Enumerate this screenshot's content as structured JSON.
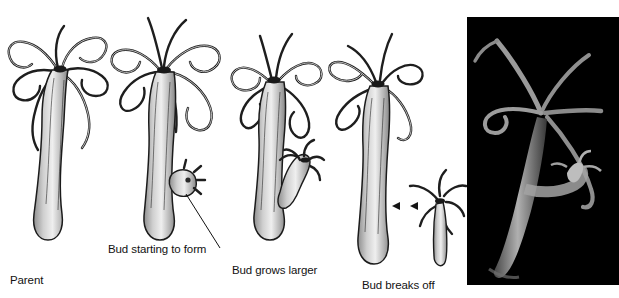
{
  "figure": {
    "background_color": "#ffffff",
    "text_color": "#121212"
  },
  "labels": {
    "parent": "Parent",
    "bud_starting": "Bud starting to form",
    "bud_larger": "Bud grows larger",
    "bud_breaks": "Bud breaks off"
  },
  "stages": [
    {
      "name": "parent-hydra",
      "caption": "Parent",
      "bud": "none"
    },
    {
      "name": "hydra-bud-starting",
      "caption": "Bud starting to form",
      "bud": "small round bud on lower body"
    },
    {
      "name": "hydra-bud-growing",
      "caption": "Bud grows larger",
      "bud": "elongated bud with small tentacles"
    },
    {
      "name": "hydra-bud-detaching",
      "caption": "Bud breaks off",
      "bud": "detached juvenile hydra"
    }
  ],
  "photo": {
    "name": "hydra-photomicrograph",
    "description": "Photomicrograph of a live hydra with a bud on a black background",
    "background_color": "#000000"
  }
}
